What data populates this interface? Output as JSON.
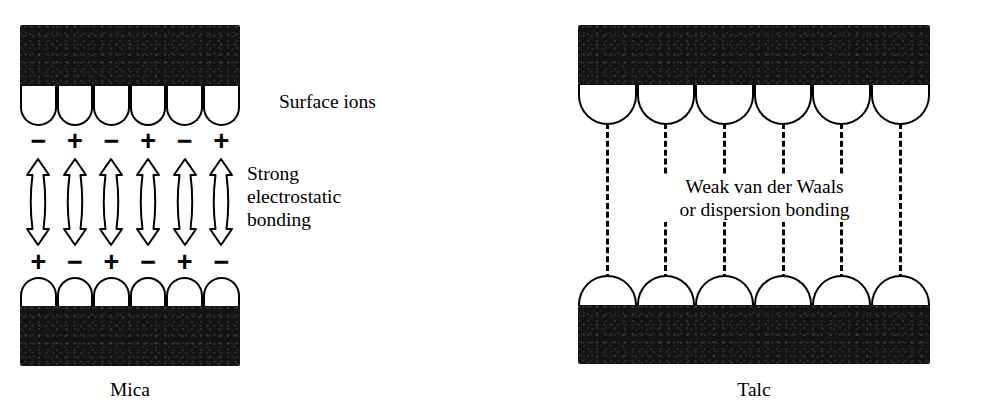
{
  "figure": {
    "ink_color": "#141414",
    "line_color": "#000000",
    "background": "#ffffff"
  },
  "panels": [
    {
      "id": "mica",
      "caption": "Mica",
      "surface_label": "Surface ions",
      "bond_label": "Strong\nelectrostatic\nbonding",
      "bond_type": "arrows",
      "lobe_count": 6,
      "top_charges": [
        "−",
        "+",
        "−",
        "+",
        "−",
        "+"
      ],
      "bottom_charges": [
        "+",
        "−",
        "+",
        "−",
        "+",
        "−"
      ]
    },
    {
      "id": "talc",
      "caption": "Talc",
      "surface_label": "",
      "bond_label": "Weak van der Waals\nor dispersion bonding",
      "bond_type": "dashed",
      "lobe_count": 6,
      "top_charges": [],
      "bottom_charges": []
    }
  ]
}
